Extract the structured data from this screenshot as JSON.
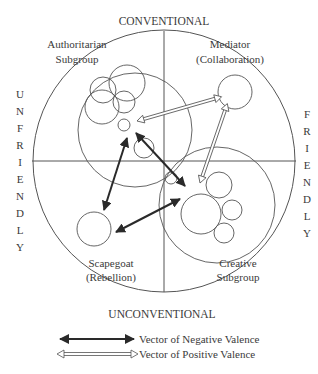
{
  "axes": {
    "top": "CONVENTIONAL",
    "bottom": "UNCONVENTIONAL",
    "left": [
      "U",
      "N",
      "F",
      "R",
      "I",
      "E",
      "N",
      "D",
      "L",
      "Y"
    ],
    "right": [
      "F",
      "R",
      "I",
      "E",
      "N",
      "D",
      "L",
      "Y"
    ]
  },
  "quadrants": {
    "top_left": [
      "Authoritarian",
      "Subgroup"
    ],
    "top_right": [
      "Mediator",
      "(Collaboration)"
    ],
    "bottom_left": [
      "Scapegoat",
      "(Rebellion)"
    ],
    "bottom_right": [
      "Creative",
      "Subgroup"
    ]
  },
  "legend": {
    "negative": "Vector of Negative Valence",
    "positive": "Vector of Positive Valence"
  },
  "colors": {
    "line": "#555555",
    "negative_arrow": "#2a2a2a",
    "positive_arrow": "#666666"
  }
}
